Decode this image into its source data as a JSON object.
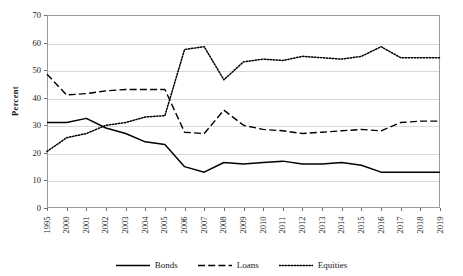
{
  "chart_data": {
    "type": "line",
    "title": "",
    "xlabel": "",
    "ylabel": "Percent",
    "ylim": [
      0,
      70
    ],
    "yticks": [
      0,
      10,
      20,
      30,
      40,
      50,
      60,
      70
    ],
    "grid": true,
    "legend_position": "bottom",
    "categories": [
      "1995",
      "2000",
      "2001",
      "2002",
      "2003",
      "2004",
      "2005",
      "2006",
      "2007",
      "2008",
      "2009",
      "2010",
      "2011",
      "2012",
      "2013",
      "2014",
      "2015",
      "2016",
      "2017",
      "2018",
      "2019"
    ],
    "series": [
      {
        "name": "Bonds",
        "style": "solid",
        "color": "#000000",
        "values": [
          31.0,
          31.0,
          32.5,
          29.0,
          27.0,
          24.0,
          23.0,
          15.0,
          13.0,
          16.5,
          16.0,
          16.5,
          17.0,
          16.0,
          16.0,
          16.5,
          15.5,
          13.0,
          13.0,
          13.0,
          13.0
        ]
      },
      {
        "name": "Loans",
        "style": "dashed",
        "color": "#000000",
        "values": [
          48.5,
          41.0,
          41.5,
          42.5,
          43.0,
          43.0,
          43.0,
          27.5,
          27.0,
          35.5,
          30.0,
          28.5,
          28.0,
          27.0,
          27.5,
          28.0,
          28.5,
          28.0,
          31.0,
          31.5,
          31.5
        ]
      },
      {
        "name": "Equities",
        "style": "dotted",
        "color": "#000000",
        "values": [
          20.5,
          25.5,
          27.0,
          30.0,
          31.0,
          33.0,
          33.5,
          57.5,
          58.5,
          46.5,
          53.0,
          54.0,
          53.5,
          55.0,
          54.5,
          54.0,
          55.0,
          58.5,
          54.5,
          54.5,
          54.5
        ]
      }
    ]
  },
  "axis": {
    "y_title": "Percent"
  }
}
